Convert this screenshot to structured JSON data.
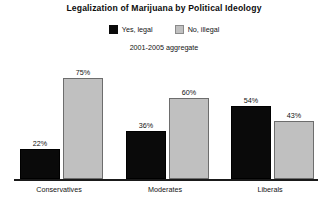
{
  "chart_data": {
    "type": "bar",
    "title": "Legalization of Marijuana by Political Ideology",
    "subtitle": "2001-2005 aggregate",
    "xlabel": "",
    "ylabel": "",
    "ylim": [
      0,
      100
    ],
    "grid": false,
    "legend_position": "top-center",
    "categories": [
      "Conservatives",
      "Moderates",
      "Liberals"
    ],
    "series": [
      {
        "name": "Yes, legal",
        "color": "#0a0a0a",
        "values": [
          22,
          36,
          54
        ],
        "labels": [
          "22%",
          "36%",
          "54%"
        ]
      },
      {
        "name": "No, illegal",
        "color": "#c0c0c0",
        "values": [
          75,
          60,
          43
        ],
        "labels": [
          "75%",
          "60%",
          "43%"
        ]
      }
    ]
  },
  "colors": {
    "yes_legal": "#0a0a0a",
    "no_illegal": "#c0c0c0",
    "axis": "#1a1a1a",
    "background": "#ffffff"
  }
}
